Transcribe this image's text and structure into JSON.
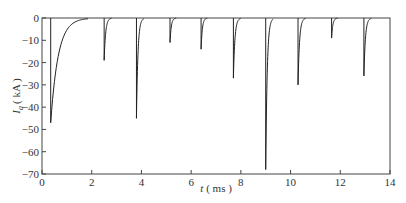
{
  "chart_data": {
    "type": "line",
    "title": "",
    "xlabel": "t ( ms )",
    "ylabel": "I_a ( kA )",
    "ylabel_main": "I",
    "ylabel_sub": "a",
    "ylabel_unit": "( kA )",
    "xlabel_var": "t",
    "xlabel_unit": "( ms )",
    "xlim": [
      0,
      14
    ],
    "ylim": [
      -70,
      0
    ],
    "xticks": [
      0,
      2,
      4,
      6,
      8,
      10,
      12,
      14
    ],
    "yticks": [
      0,
      -10,
      -20,
      -30,
      -40,
      -50,
      -60,
      -70
    ],
    "xtick_labels": [
      "0",
      "2",
      "4",
      "6",
      "8",
      "10",
      "12",
      "14"
    ],
    "ytick_labels": [
      "0",
      "-10",
      "-20",
      "-30",
      "-40",
      "-50",
      "-60",
      "-70"
    ],
    "grid": false,
    "legend": null,
    "series": [
      {
        "name": "I_a",
        "description": "Sequence of negative current pulses with sharp onset and exponential recovery to 0",
        "pulses": [
          {
            "t": 0.35,
            "peak": -47,
            "decay_ms": 0.3
          },
          {
            "t": 2.5,
            "peak": -19,
            "decay_ms": 0.06
          },
          {
            "t": 3.8,
            "peak": -45,
            "decay_ms": 0.06
          },
          {
            "t": 5.15,
            "peak": -11,
            "decay_ms": 0.05
          },
          {
            "t": 6.4,
            "peak": -14,
            "decay_ms": 0.05
          },
          {
            "t": 7.7,
            "peak": -27,
            "decay_ms": 0.06
          },
          {
            "t": 9.0,
            "peak": -68,
            "decay_ms": 0.06
          },
          {
            "t": 10.3,
            "peak": -30,
            "decay_ms": 0.06
          },
          {
            "t": 11.65,
            "peak": -9,
            "decay_ms": 0.05
          },
          {
            "t": 12.95,
            "peak": -26,
            "decay_ms": 0.06
          }
        ]
      }
    ],
    "colors": {
      "line": "#222222",
      "axis": "#444444",
      "text": "#333333"
    }
  }
}
